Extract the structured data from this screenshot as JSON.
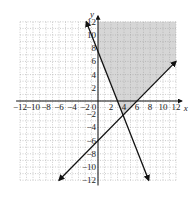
{
  "chart_data": {
    "type": "line",
    "title": "",
    "xlabel": "x",
    "ylabel": "y",
    "xlim": [
      -12,
      12
    ],
    "ylim": [
      -12,
      12
    ],
    "grid": true,
    "x_ticks": [
      "-12",
      "-10",
      "-8",
      "-6",
      "-4",
      "-2",
      "0",
      "2",
      "4",
      "6",
      "8",
      "10",
      "12"
    ],
    "y_ticks": [
      "12",
      "10",
      "8",
      "6",
      "4",
      "2",
      "-2",
      "-4",
      "-6",
      "-8",
      "-10",
      "-12"
    ],
    "series": [
      {
        "name": "line 1",
        "equation": "y = -2.5x + 7.5",
        "x": [
          -1.8,
          7.8
        ],
        "y": [
          12,
          -12
        ]
      },
      {
        "name": "line 2",
        "equation": "y = x - 6",
        "x": [
          -6,
          12
        ],
        "y": [
          -12,
          6
        ]
      }
    ],
    "shaded_region": {
      "description": "region above both lines, x >= 0",
      "color": "#d6d6d6"
    }
  }
}
